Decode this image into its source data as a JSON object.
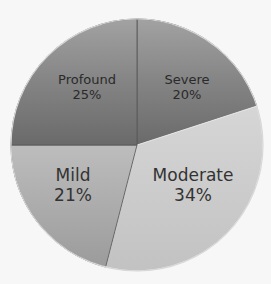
{
  "chart_data": {
    "type": "pie",
    "title": "",
    "start_angle_deg": 0,
    "direction": "clockwise",
    "slices": [
      {
        "label": "Severe",
        "value": 20,
        "display": "20%",
        "color": "#7d7d7d"
      },
      {
        "label": "Moderate",
        "value": 34,
        "display": "34%",
        "color": "#c9c9c9"
      },
      {
        "label": "Mild",
        "value": 21,
        "display": "21%",
        "color": "#ababab"
      },
      {
        "label": "Profound",
        "value": 25,
        "display": "25%",
        "color": "#737373"
      }
    ],
    "categories": [
      "Severe",
      "Moderate",
      "Mild",
      "Profound"
    ],
    "values": [
      20,
      34,
      21,
      25
    ],
    "legend": "none",
    "data_labels": "inside (category + percent)"
  },
  "labels": {
    "severe": {
      "name": "Severe",
      "pct": "20%"
    },
    "moderate": {
      "name": "Moderate",
      "pct": "34%"
    },
    "mild": {
      "name": "Mild",
      "pct": "21%"
    },
    "profound": {
      "name": "Profound",
      "pct": "25%"
    }
  }
}
